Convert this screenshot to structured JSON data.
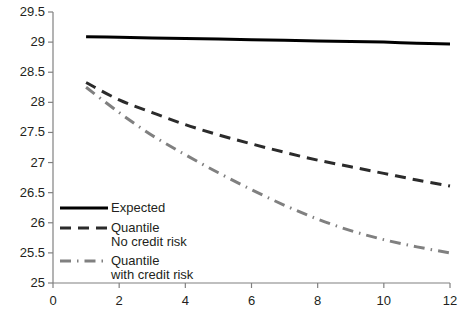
{
  "chart_data": {
    "type": "line",
    "title": "",
    "xlabel": "",
    "ylabel": "",
    "xlim": [
      0,
      12
    ],
    "ylim": [
      25,
      29.5
    ],
    "grid": false,
    "legend_position": "inside-lower-left",
    "xticks": [
      "0",
      "2",
      "4",
      "6",
      "8",
      "10",
      "12"
    ],
    "xtick_values": [
      0,
      2,
      4,
      6,
      8,
      10,
      12
    ],
    "yticks": [
      "25",
      "25.5",
      "26",
      "26.5",
      "27",
      "27.5",
      "28",
      "28.5",
      "29",
      "29.5"
    ],
    "ytick_values": [
      25,
      25.5,
      26,
      26.5,
      27,
      27.5,
      28,
      28.5,
      29,
      29.5
    ],
    "x": [
      1,
      2,
      3,
      4,
      5,
      6,
      7,
      8,
      9,
      10,
      11,
      12
    ],
    "series": [
      {
        "name": "Expected",
        "label": "Expected",
        "style": "solid",
        "color": "#000000",
        "width": 3,
        "values": [
          29.09,
          29.08,
          29.07,
          29.06,
          29.05,
          29.04,
          29.03,
          29.02,
          29.01,
          29.0,
          28.98,
          28.97
        ]
      },
      {
        "name": "Quantile No credit risk",
        "label": "Quantile\nNo credit risk",
        "style": "dashed",
        "color": "#2b2b2b",
        "width": 3,
        "values": [
          28.33,
          28.04,
          27.83,
          27.63,
          27.46,
          27.31,
          27.17,
          27.04,
          26.93,
          26.82,
          26.71,
          26.61
        ]
      },
      {
        "name": "Quantile with credit risk",
        "label": "Quantile\nwith credit risk",
        "style": "dashdot",
        "color": "#808080",
        "width": 3,
        "values": [
          28.25,
          27.83,
          27.45,
          27.13,
          26.83,
          26.55,
          26.29,
          26.06,
          25.87,
          25.72,
          25.6,
          25.5
        ]
      }
    ]
  },
  "axis": {
    "line_color": "#808080",
    "text_color": "#231f20"
  }
}
